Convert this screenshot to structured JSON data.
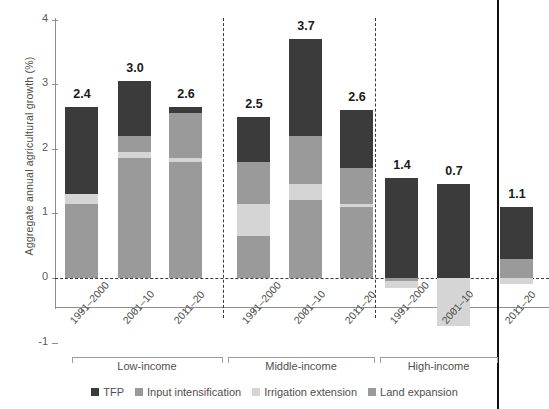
{
  "chart_data": {
    "type": "bar",
    "subtype": "stacked-bar-with-negatives",
    "title": "",
    "xlabel": "",
    "ylabel": "Aggregate annual agricultural growth (%)",
    "ylim": [
      -1,
      4
    ],
    "yticks": [
      -1,
      0,
      1,
      2,
      3,
      4
    ],
    "ytick_labels": [
      "-1",
      "0",
      "1",
      "2",
      "3",
      "4"
    ],
    "grid": false,
    "zero_line": true,
    "legend_position": "bottom",
    "groups": [
      "Low-income",
      "Middle-income",
      "High-income"
    ],
    "categories": [
      "1991–2000",
      "2001–10",
      "2011–20",
      "1991–2000",
      "2001–10",
      "2011–20",
      "1991–2000",
      "2001–10",
      "2011–20"
    ],
    "totals": [
      2.4,
      3.0,
      2.6,
      2.5,
      3.7,
      2.6,
      1.4,
      0.7,
      1.1
    ],
    "series": [
      {
        "name": "TFP",
        "color": "#3b3b3b",
        "values": [
          1.35,
          0.85,
          0.1,
          0.7,
          1.5,
          0.9,
          1.55,
          1.45,
          0.8
        ]
      },
      {
        "name": "Input intensification",
        "color": "#9a9a9a",
        "values": [
          0.0,
          0.25,
          0.7,
          0.65,
          0.75,
          0.55,
          0.0,
          0.0,
          0.2
        ]
      },
      {
        "name": "Irrigation extension",
        "color": "#d5d5d5",
        "values": [
          0.15,
          0.1,
          0.05,
          0.5,
          0.25,
          0.05,
          -0.1,
          -0.75,
          -0.1
        ]
      },
      {
        "name": "Land expansion",
        "color": "#9a9a9a",
        "values": [
          1.15,
          1.85,
          1.8,
          0.65,
          1.2,
          1.1,
          -0.05,
          0.0,
          0.1
        ]
      }
    ],
    "negative_note": "High-income 1991–2000 and 2011–20 have small negative irrigation/land segments; 2001–10 has a large negative irrigation extension segment reaching about -0.75."
  },
  "axis": {
    "y_label": "Aggregate annual agricultural growth (%)",
    "y_ticks": [
      "4",
      "3",
      "2",
      "1",
      "0",
      "-1"
    ]
  },
  "groups": [
    {
      "label": "Low-income"
    },
    {
      "label": "Middle-income"
    },
    {
      "label": "High-income"
    }
  ],
  "bars": [
    {
      "label": "1991–2000",
      "value": "2.4"
    },
    {
      "label": "2001–10",
      "value": "3.0"
    },
    {
      "label": "2011–20",
      "value": "2.6"
    },
    {
      "label": "1991–2000",
      "value": "2.5"
    },
    {
      "label": "2001–10",
      "value": "3.7"
    },
    {
      "label": "2011–20",
      "value": "2.6"
    },
    {
      "label": "1991–2000",
      "value": "1.4"
    },
    {
      "label": "2001–10",
      "value": "0.7"
    },
    {
      "label": "2011–20",
      "value": "1.1"
    }
  ],
  "legend": [
    {
      "label": "TFP",
      "color": "#3b3b3b"
    },
    {
      "label": "Input intensification",
      "color": "#9a9a9a"
    },
    {
      "label": "Irrigation extension",
      "color": "#d5d5d5"
    },
    {
      "label": "Land expansion",
      "color": "#9a9a9a"
    }
  ]
}
